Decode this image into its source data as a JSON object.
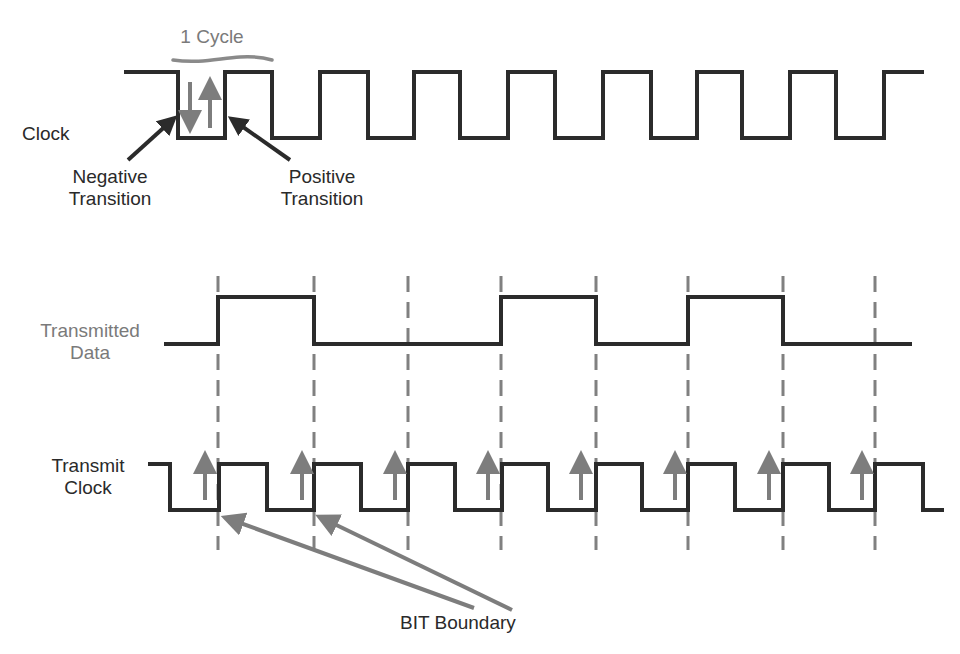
{
  "colors": {
    "wave": "#2b2b2b",
    "accent_gray": "#7d7d7d",
    "dash": "#808080",
    "background": "#ffffff"
  },
  "top_section": {
    "clock_label": "Clock",
    "cycle_label": "1 Cycle",
    "negative_label": "Negative\nTransition",
    "positive_label": "Positive\nTransition",
    "clock_wave": {
      "high_y": 72,
      "low_y": 138,
      "start_x": 124,
      "end_x": 924,
      "start_level": "high",
      "edges_x": [
        178,
        225,
        272,
        320,
        368,
        414,
        460,
        508,
        555,
        603,
        651,
        697,
        742,
        790,
        836,
        884
      ]
    }
  },
  "bottom_section": {
    "transmitted_data_label": "Transmitted\nData",
    "transmit_clock_label": "Transmit\nClock",
    "bit_boundary_label": "BIT Boundary",
    "data_wave": {
      "high_y": 297,
      "low_y": 344,
      "start_x": 164,
      "end_x": 912,
      "start_level": "low",
      "edges_x": [
        218,
        314,
        501,
        596,
        688,
        783
      ]
    },
    "transmit_clock_wave": {
      "high_y": 464,
      "low_y": 510,
      "start_x": 148,
      "end_x": 944,
      "start_level": "high",
      "edges_x": [
        170,
        219,
        267,
        314,
        361,
        408,
        455,
        502,
        548,
        596,
        642,
        688,
        735,
        783,
        829,
        875,
        923
      ]
    },
    "bit_boundaries_x": [
      218,
      314,
      408,
      501,
      596,
      688,
      783,
      875
    ],
    "sample_arrows_x": [
      205,
      302,
      395,
      488,
      581,
      675,
      769,
      862
    ]
  }
}
